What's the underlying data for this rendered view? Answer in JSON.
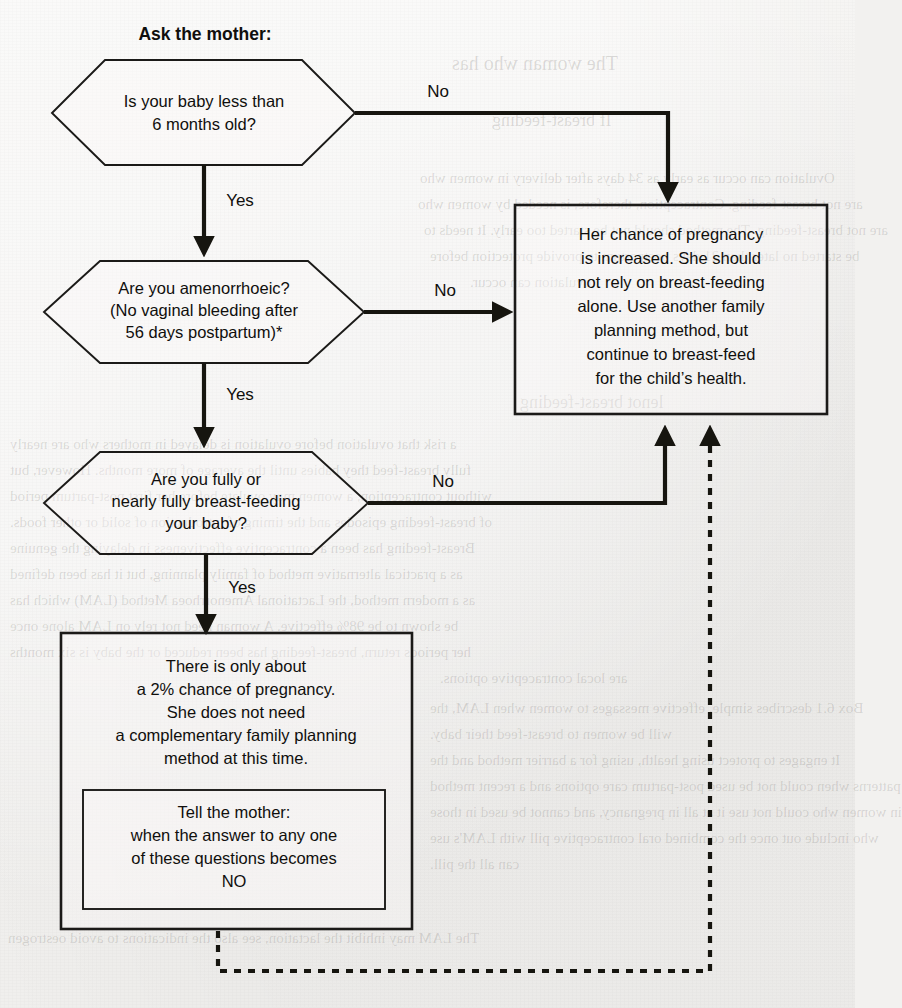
{
  "page": {
    "background_color": "#f2f1ef",
    "ink_color": "#100f0d",
    "width": 855,
    "height": 1008
  },
  "heading": {
    "text": "Ask the mother:"
  },
  "decisions": [
    {
      "id": "q1",
      "lines": [
        "Is your baby less than",
        "6 months old?"
      ],
      "yes_label": "Yes",
      "no_label": "No"
    },
    {
      "id": "q2",
      "lines": [
        "Are you amenorrhoeic?",
        "(No vaginal bleeding after",
        "56 days postpartum)*"
      ],
      "yes_label": "Yes",
      "no_label": "No"
    },
    {
      "id": "q3",
      "lines": [
        "Are you fully or",
        "nearly fully breast-feeding",
        "your baby?"
      ],
      "yes_label": "Yes",
      "no_label": "No"
    }
  ],
  "outcomes": {
    "increased_risk": {
      "lines": [
        "Her chance of pregnancy",
        "is increased. She should",
        "not rely on breast-feeding",
        "alone. Use another family",
        "planning method, but",
        "continue to breast-feed",
        "for the child’s health."
      ]
    },
    "low_risk": {
      "lines": [
        "There is only about",
        "a 2% chance of pregnancy.",
        "She does not need",
        "a complementary family planning",
        "method at this time."
      ],
      "nested_note": {
        "lines": [
          "Tell the mother:",
          "when the answer to any one",
          "of these questions becomes",
          "NO"
        ]
      }
    }
  },
  "bleed_through_text": [
    "The woman who has",
    "lenot breast-feeding",
    "Ovulation can occur as early as 34 days after delivery in women who",
    "are not breast-feeding. Contraception, therefore, is needed by women who",
    "are not breast-feeding. The method should not be started too early. It needs to",
    "be started no later than 21 days postpartum to provide protection before",
    "ovulation can occur.",
    "If breast-feeding",
    "a risk that ovulation before ovulation is delayed in mothers who are nearly",
    "fully breast-feed they babies until the average of more months. However, but",
    "without contraception, a women may ovulate before her first post-partum period",
    "of breast-feeding episodes and the timing of introduction of solid or other foods.",
    "Breast-feeding has been a contraceptive effectiveness in delaying the genuine",
    "as a practical alternative method of family planning, but it has been defined",
    "as a modern method, the Lactational Amenorrhoea Method (LAM) which has",
    "be shown to be 98% effective. A woman need not rely on LAM alone once",
    "her periods return, breast-feeding has been reduced or the baby is six months",
    "are local contraceptive options.",
    "Box 6.1 describes simple, effective messages to women when LAM, the",
    "will be women to breast-feed their baby.",
    "It engages to protect using health, using for a barrier method and the",
    "patterns when could not be used post-partum care options and a recent method",
    "in women who could not use it at all in pregnancy, and cannot be used in those",
    "who include out once the combined oral contraceptive pill with LAM's use",
    "can all the pill.",
    "The LAM may inhibit the lactation, see also the indications to avoid oestrogen"
  ]
}
